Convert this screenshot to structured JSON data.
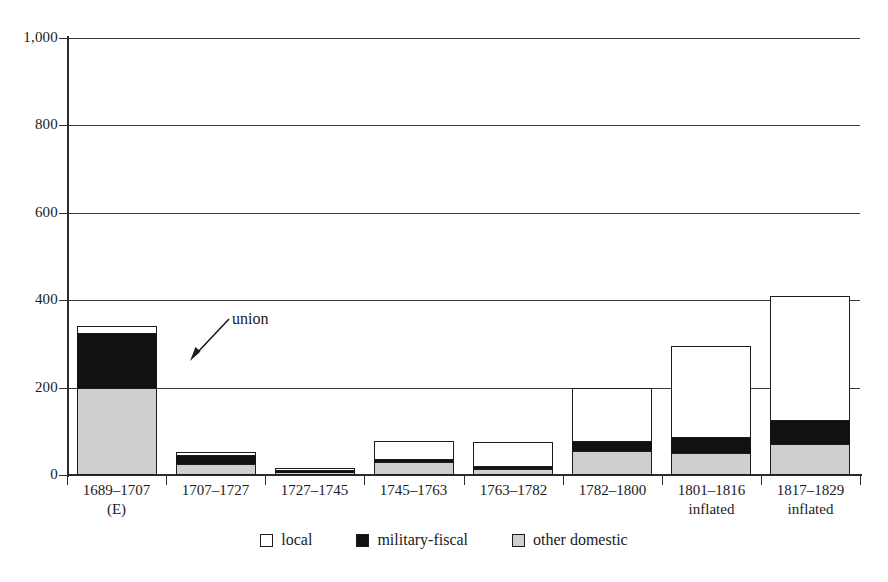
{
  "chart_data": {
    "type": "bar",
    "subtype": "stacked-bar",
    "title": "",
    "xlabel": "",
    "ylabel": "",
    "ylim": [
      0,
      1000
    ],
    "yticks": [
      0,
      200,
      400,
      600,
      800,
      1000
    ],
    "ytick_labels": [
      "0",
      "200",
      "400",
      "600",
      "800",
      "1,000"
    ],
    "grid": "horizontal",
    "legend_position": "bottom-center",
    "categories": [
      "1689–1707",
      "1707–1727",
      "1727–1745",
      "1745–1763",
      "1763–1782",
      "1782–1800",
      "1801–1816",
      "1817–1829"
    ],
    "category_sublabels": [
      "(E)",
      "",
      "",
      "",
      "",
      "",
      "inflated",
      "inflated"
    ],
    "series": [
      {
        "name": "other domestic",
        "color": "#cfcfcf",
        "values": [
          200,
          25,
          6,
          29,
          14,
          55,
          51,
          72
        ]
      },
      {
        "name": "military-fiscal",
        "color": "#111111",
        "values": [
          122,
          18,
          4,
          5,
          5,
          20,
          34,
          52
        ]
      },
      {
        "name": "local",
        "color": "#ffffff",
        "values": [
          19,
          9,
          5,
          43,
          57,
          123,
          210,
          285
        ]
      }
    ],
    "totals": [
      341,
      52,
      15,
      77,
      76,
      198,
      295,
      409
    ],
    "annotations": [
      {
        "text": "union",
        "target_category": "1707–1727",
        "arrow": "down-left"
      }
    ]
  },
  "legend": {
    "items": [
      {
        "label": "local",
        "swatch": "white-square-icon"
      },
      {
        "label": "military-fiscal",
        "swatch": "black-square-icon"
      },
      {
        "label": "other domestic",
        "swatch": "gray-square-icon"
      }
    ]
  },
  "colors": {
    "local": "#ffffff",
    "military_fiscal": "#111111",
    "other_domestic": "#cfcfcf",
    "axis": "#2b2b2b",
    "grid": "#3a3a3a",
    "background": "#ffffff"
  }
}
